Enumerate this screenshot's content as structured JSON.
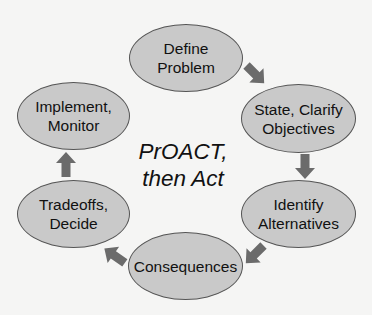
{
  "diagram": {
    "title": "PrOACT, then Act",
    "center_line1": "PrOACT,",
    "center_line2": "then Act",
    "nodes": [
      {
        "id": "define",
        "line1": "Define",
        "line2": "Problem"
      },
      {
        "id": "objectives",
        "line1": "State, Clarify",
        "line2": "Objectives"
      },
      {
        "id": "alternatives",
        "line1": "Identify",
        "line2": "Alternatives"
      },
      {
        "id": "consequences",
        "line1": "Consequences",
        "line2": ""
      },
      {
        "id": "tradeoffs",
        "line1": "Tradeoffs,",
        "line2": "Decide"
      },
      {
        "id": "implement",
        "line1": "Implement,",
        "line2": "Monitor"
      }
    ],
    "flow": [
      "define",
      "objectives",
      "alternatives",
      "consequences",
      "tradeoffs",
      "implement"
    ],
    "colors": {
      "node_fill": "#c9c9c9",
      "node_border": "#555555",
      "arrow": "#6b6b6b",
      "background": "#f5f5f4"
    }
  }
}
